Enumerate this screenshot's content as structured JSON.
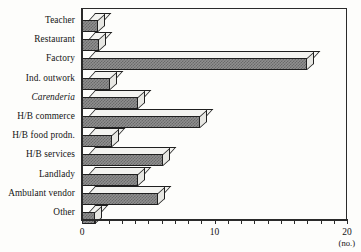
{
  "chart_data": {
    "type": "bar",
    "orientation": "horizontal",
    "title": "",
    "xlabel": "(no.)",
    "ylabel": "",
    "xlim": [
      0,
      20
    ],
    "xticks": [
      0,
      1,
      2,
      3,
      4,
      5,
      6,
      7,
      8,
      9,
      10,
      11,
      12,
      13,
      14,
      15,
      16,
      17,
      18,
      19,
      20
    ],
    "xtick_labels": [
      "0",
      "10",
      "20"
    ],
    "labeled_xticks": [
      0,
      10,
      20
    ],
    "grid": false,
    "legend": false,
    "style": "3d-bar",
    "categories": [
      "Teacher",
      "Restaurant",
      "Factory",
      "Ind. outwork",
      "Carenderia",
      "H/B commerce",
      "H/B food prodn.",
      "H/B services",
      "Landlady",
      "Ambulant vendor",
      "Other"
    ],
    "category_styles": [
      "normal",
      "normal",
      "normal",
      "normal",
      "italic",
      "normal",
      "normal",
      "normal",
      "normal",
      "normal",
      "normal"
    ],
    "values": [
      1.2,
      1.3,
      17.0,
      2.1,
      4.2,
      8.9,
      2.3,
      6.1,
      4.2,
      5.7,
      1.0
    ]
  },
  "axis": {
    "unit": "(no.)",
    "zero_label": "0",
    "mid_label": "10",
    "max_label": "20"
  },
  "colors": {
    "bar_fill": "#8f8f8f",
    "bar_hatch": "#6a6a6a",
    "bar_top": "#f3f3f0",
    "bar_side": "#e7e7e3",
    "outline": "#1f1f1f",
    "axis": "#2a2a2a",
    "text": "#141414",
    "background": "#fdfdfb"
  }
}
